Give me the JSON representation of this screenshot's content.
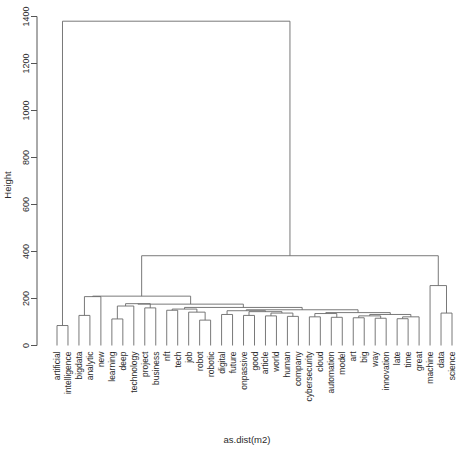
{
  "chart_data": {
    "type": "dendrogram",
    "title": "",
    "xlabel": "as.dist(m2)",
    "ylabel": "Height",
    "ylim": [
      0,
      1400
    ],
    "yticks": [
      0,
      200,
      400,
      600,
      800,
      1000,
      1200,
      1400
    ],
    "ytick_labels": [
      "0",
      "200",
      "400",
      "600",
      "800",
      "1000",
      "1200",
      "1400"
    ],
    "grid": false,
    "legend": "none",
    "line_color": "#6a6a6a",
    "axis_color": "#555555",
    "background": "#ffffff",
    "n_leaves": 37,
    "leaf_labels": [
      "artificial",
      "intelligence",
      "bigdata",
      "analytic",
      "new",
      "learning",
      "deep",
      "technology",
      "project",
      "business",
      "nft",
      "tech",
      "job",
      "robot",
      "robotic",
      "digital",
      "future",
      "onpassive",
      "good",
      "article",
      "world",
      "human",
      "company",
      "cybersecurity",
      "cloud",
      "automation",
      "model",
      "art",
      "big",
      "way",
      "innovation",
      "late",
      "time",
      "great",
      "machine",
      "data",
      "science"
    ],
    "merges": [
      {
        "id": "m1",
        "left": "artificial",
        "right": "intelligence",
        "height": 85
      },
      {
        "id": "m2",
        "left": "bigdata",
        "right": "analytic",
        "height": 128
      },
      {
        "id": "m3",
        "left": "learning",
        "right": "deep",
        "height": 113
      },
      {
        "id": "m4",
        "left": "robot",
        "right": "robotic",
        "height": 108
      },
      {
        "id": "m5",
        "left": "m2",
        "right": "new",
        "height": 208
      },
      {
        "id": "m6",
        "left": "m3",
        "right": "technology",
        "height": 168
      },
      {
        "id": "m7",
        "left": "project",
        "right": "business",
        "height": 160
      },
      {
        "id": "m8",
        "left": "m6",
        "right": "m7",
        "height": 178
      },
      {
        "id": "m9",
        "left": "nft",
        "right": "tech",
        "height": 150
      },
      {
        "id": "m10",
        "left": "job",
        "right": "m4",
        "height": 142
      },
      {
        "id": "m11",
        "left": "m9",
        "right": "m10",
        "height": 155
      },
      {
        "id": "m12",
        "left": "digital",
        "right": "future",
        "height": 132
      },
      {
        "id": "m13",
        "left": "onpassive",
        "right": "good",
        "height": 128
      },
      {
        "id": "m14",
        "left": "article",
        "right": "world",
        "height": 126
      },
      {
        "id": "m15",
        "left": "human",
        "right": "company",
        "height": 124
      },
      {
        "id": "m16",
        "left": "cybersecurity",
        "right": "cloud",
        "height": 122
      },
      {
        "id": "m17",
        "left": "automation",
        "right": "model",
        "height": 120
      },
      {
        "id": "m18",
        "left": "art",
        "right": "big",
        "height": 118
      },
      {
        "id": "m19",
        "left": "way",
        "right": "innovation",
        "height": 116
      },
      {
        "id": "m20",
        "left": "late",
        "right": "time",
        "height": 114
      },
      {
        "id": "m21",
        "left": "m20",
        "right": "great",
        "height": 122
      },
      {
        "id": "m22",
        "left": "m18",
        "right": "m19",
        "height": 126
      },
      {
        "id": "m23",
        "left": "m22",
        "right": "m21",
        "height": 132
      },
      {
        "id": "m24",
        "left": "m16",
        "right": "m17",
        "height": 136
      },
      {
        "id": "m25",
        "left": "m24",
        "right": "m23",
        "height": 140
      },
      {
        "id": "m26",
        "left": "m14",
        "right": "m15",
        "height": 138
      },
      {
        "id": "m27",
        "left": "m13",
        "right": "m26",
        "height": 144
      },
      {
        "id": "m28",
        "left": "m12",
        "right": "m27",
        "height": 148
      },
      {
        "id": "m29",
        "left": "m28",
        "right": "m25",
        "height": 152
      },
      {
        "id": "m30",
        "left": "m11",
        "right": "m29",
        "height": 162
      },
      {
        "id": "m31",
        "left": "m8",
        "right": "m30",
        "height": 176
      },
      {
        "id": "m32",
        "left": "m5",
        "right": "m31",
        "height": 210
      },
      {
        "id": "m33",
        "left": "data",
        "right": "science",
        "height": 138
      },
      {
        "id": "m34",
        "left": "machine",
        "right": "m33",
        "height": 255
      },
      {
        "id": "m35",
        "left": "m32",
        "right": "m34",
        "height": 382
      },
      {
        "id": "m36",
        "left": "m1",
        "right": "m35",
        "height": 1380
      }
    ]
  },
  "axes": {
    "y_title": "Height",
    "x_title": "as.dist(m2)"
  }
}
